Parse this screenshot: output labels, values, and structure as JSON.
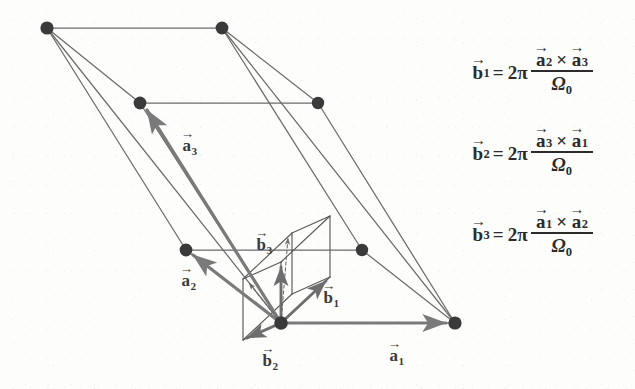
{
  "figure": {
    "background_color": "#fdfdfc",
    "node_color": "#3a3a3a",
    "direct_line_color": "#6b6b6b",
    "direct_vector_color": "#7a7a7a",
    "reciprocal_line_color": "#5a5a5a",
    "reciprocal_vector_color": "#6e6e6e",
    "text_color": "#2b2b2b"
  },
  "labels": {
    "a1": {
      "base": "a",
      "sub": "1",
      "arrow": "→",
      "x": 389,
      "y": 346
    },
    "a2": {
      "base": "a",
      "sub": "2",
      "arrow": "→",
      "x": 181,
      "y": 271
    },
    "a3": {
      "base": "a",
      "sub": "3",
      "arrow": "→",
      "x": 182,
      "y": 136
    },
    "b1": {
      "base": "b",
      "sub": "1",
      "arrow": "→",
      "x": 323,
      "y": 288
    },
    "b2": {
      "base": "b",
      "sub": "2",
      "arrow": "→",
      "x": 262,
      "y": 351
    },
    "b3": {
      "base": "b",
      "sub": "3",
      "arrow": "→",
      "x": 256,
      "y": 235
    }
  },
  "equations": [
    {
      "lhs_base": "b",
      "lhs_sub": "1",
      "equals": "=",
      "coefficient": "2π",
      "numerator": {
        "left_base": "a",
        "left_sub": "2",
        "op": "×",
        "right_base": "a",
        "right_sub": "3"
      },
      "denominator_base": "Ω",
      "denominator_sub": "0"
    },
    {
      "lhs_base": "b",
      "lhs_sub": "2",
      "equals": "=",
      "coefficient": "2π",
      "numerator": {
        "left_base": "a",
        "left_sub": "3",
        "op": "×",
        "right_base": "a",
        "right_sub": "1"
      },
      "denominator_base": "Ω",
      "denominator_sub": "0"
    },
    {
      "lhs_base": "b",
      "lhs_sub": "3",
      "equals": "=",
      "coefficient": "2π",
      "numerator": {
        "left_base": "a",
        "left_sub": "1",
        "op": "×",
        "right_base": "a",
        "right_sub": "2"
      },
      "denominator_base": "Ω",
      "denominator_sub": "0"
    }
  ],
  "geometry": {
    "lattice_nodes": [
      {
        "name": "top-back-left",
        "x": 47,
        "y": 28
      },
      {
        "name": "top-back-right",
        "x": 222,
        "y": 28
      },
      {
        "name": "top-front-left",
        "x": 140,
        "y": 103
      },
      {
        "name": "top-front-right",
        "x": 318,
        "y": 103
      },
      {
        "name": "bot-back-left",
        "x": 186,
        "y": 250
      },
      {
        "name": "bot-back-right",
        "x": 362,
        "y": 250
      },
      {
        "name": "origin",
        "x": 281,
        "y": 323
      },
      {
        "name": "bot-front-right",
        "x": 455,
        "y": 323
      }
    ],
    "direct_vectors": [
      {
        "name": "a1",
        "from": [
          281,
          323
        ],
        "to": [
          452,
          323
        ]
      },
      {
        "name": "a2",
        "from": [
          281,
          323
        ],
        "to": [
          189,
          252
        ]
      },
      {
        "name": "a3",
        "from": [
          281,
          323
        ],
        "to": [
          142,
          105
        ]
      }
    ],
    "reciprocal_vectors": [
      {
        "name": "b1",
        "from": [
          281,
          323
        ],
        "to": [
          330,
          277
        ]
      },
      {
        "name": "b2",
        "from": [
          281,
          323
        ],
        "to": [
          243,
          340
        ]
      },
      {
        "name": "b3",
        "from": [
          281,
          323
        ],
        "to": [
          281,
          262
        ]
      }
    ]
  }
}
